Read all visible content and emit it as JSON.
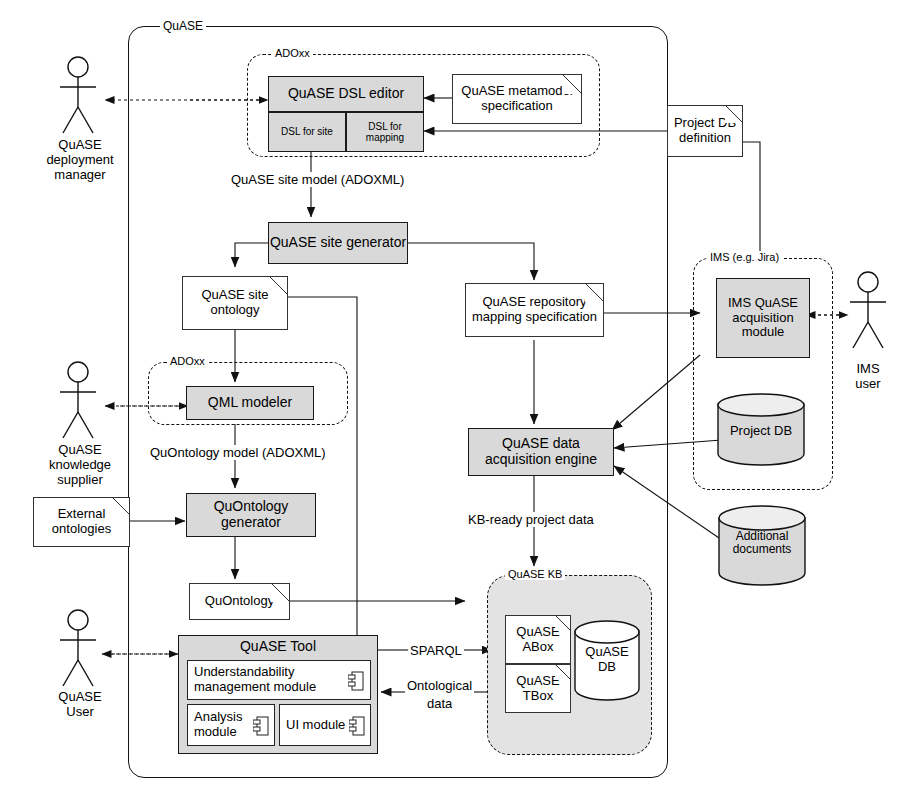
{
  "diagram": {
    "frames": [
      {
        "id": "quase",
        "label": "QuASE",
        "style": "solid"
      },
      {
        "id": "adoxx_top",
        "label": "ADOxx",
        "style": "dashed"
      },
      {
        "id": "adoxx_mid",
        "label": "ADOxx",
        "style": "dashed"
      },
      {
        "id": "ims",
        "label": "IMS (e.g. Jira)",
        "style": "dashed"
      },
      {
        "id": "kb",
        "label": "QuASE KB",
        "style": "dashed-filled"
      }
    ],
    "actors": [
      {
        "id": "deployment-manager",
        "lines": [
          "QuASE",
          "deployment",
          "manager"
        ]
      },
      {
        "id": "knowledge-supplier",
        "lines": [
          "QuASE",
          "knowledge",
          "supplier"
        ]
      },
      {
        "id": "quase-user",
        "lines": [
          "QuASE",
          "User"
        ]
      },
      {
        "id": "ims-user",
        "lines": [
          "IMS",
          "user"
        ]
      }
    ],
    "components": [
      {
        "id": "dsl-editor",
        "label": "QuASE DSL editor"
      },
      {
        "id": "dsl-for-site",
        "label": "DSL for site"
      },
      {
        "id": "dsl-for-mapping",
        "label": "DSL for mapping"
      },
      {
        "id": "site-generator",
        "label": "QuASE site generator"
      },
      {
        "id": "qml-modeler",
        "label": "QML modeler"
      },
      {
        "id": "quontology-generator",
        "label": "QuOntology generator"
      },
      {
        "id": "ims-acquisition-module",
        "label": "IMS QuASE acquisition module"
      },
      {
        "id": "data-acquisition-engine",
        "label": "QuASE data acquisition engine"
      },
      {
        "id": "quase-tool",
        "label": "QuASE Tool"
      },
      {
        "id": "understandability-module",
        "label": "Understandability management module"
      },
      {
        "id": "analysis-module",
        "label": "Analysis module"
      },
      {
        "id": "ui-module",
        "label": "UI module"
      }
    ],
    "artifacts": [
      {
        "id": "metamodel-spec",
        "label": "QuASE metamodel specification"
      },
      {
        "id": "project-db-definition",
        "label": "Project DB definition"
      },
      {
        "id": "site-ontology",
        "label": "QuASE site ontology"
      },
      {
        "id": "repository-mapping-spec",
        "label": "QuASE repository mapping specification"
      },
      {
        "id": "quontology",
        "label": "QuOntology"
      },
      {
        "id": "quase-abox",
        "label": "QuASE ABox"
      },
      {
        "id": "quase-tbox",
        "label": "QuASE TBox"
      },
      {
        "id": "external-ontologies",
        "label": "External ontologies"
      }
    ],
    "databases": [
      {
        "id": "project-db",
        "label": "Project DB"
      },
      {
        "id": "additional-documents",
        "label": "Additional documents"
      },
      {
        "id": "quase-db",
        "label": "QuASE DB"
      }
    ],
    "edge_labels": [
      {
        "id": "site-model",
        "text": "QuASE site model (ADOXML)"
      },
      {
        "id": "quontology-model",
        "text": "QuOntology model (ADOXML)"
      },
      {
        "id": "kb-ready",
        "text": "KB-ready project data"
      },
      {
        "id": "sparql",
        "text": "SPARQL"
      },
      {
        "id": "ontological-data-1",
        "text": "Ontological"
      },
      {
        "id": "ontological-data-2",
        "text": "data"
      }
    ],
    "colors": {
      "fill": "#d9d9d9",
      "kb_fill": "#e3e3e3",
      "stroke": "#111111",
      "paper": "#ffffff"
    }
  }
}
